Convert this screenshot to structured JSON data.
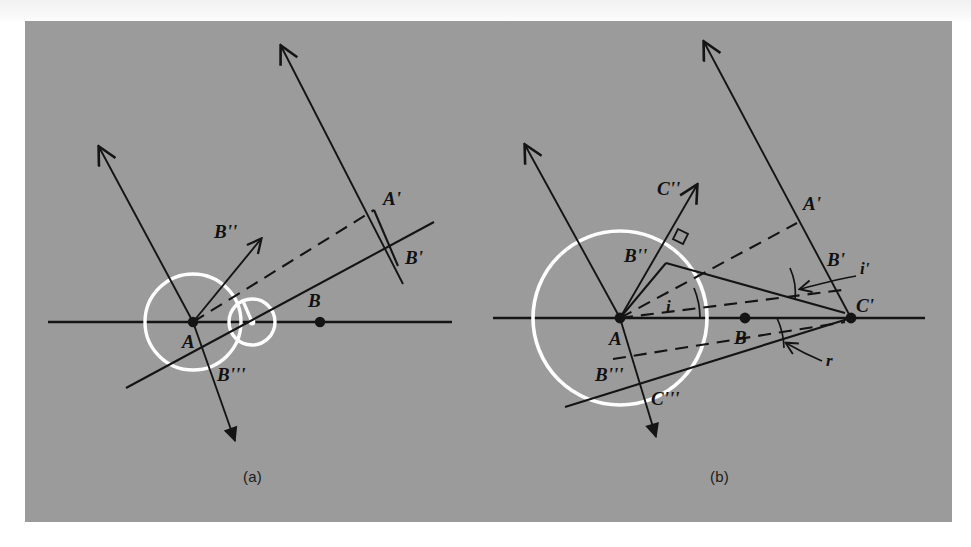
{
  "figure": {
    "kind": "huygens-refraction-construction",
    "panel_background_color": "#999999",
    "page_background_color": "#ffffff",
    "ray_color": "#141414",
    "wavelet_color": "#ffffff",
    "panels": [
      {
        "id": "a",
        "caption": "(a)",
        "points": [
          {
            "name": "A",
            "label": "A"
          },
          {
            "name": "B",
            "label": "B"
          },
          {
            "name": "A-prime",
            "label": "A'"
          },
          {
            "name": "B-prime",
            "label": "B'"
          },
          {
            "name": "B-double-prime",
            "label": "B''"
          },
          {
            "name": "B-triple-prime",
            "label": "B'''"
          }
        ],
        "angles": []
      },
      {
        "id": "b",
        "caption": "(b)",
        "points": [
          {
            "name": "A",
            "label": "A"
          },
          {
            "name": "B",
            "label": "B"
          },
          {
            "name": "A-prime",
            "label": "A'"
          },
          {
            "name": "B-prime",
            "label": "B'"
          },
          {
            "name": "C-prime",
            "label": "C'"
          },
          {
            "name": "B-double-prime",
            "label": "B''"
          },
          {
            "name": "C-double-prime",
            "label": "C''"
          },
          {
            "name": "B-triple-prime",
            "label": "B'''"
          },
          {
            "name": "C-triple-prime",
            "label": "C'''"
          }
        ],
        "angles": [
          {
            "name": "angle-of-incidence",
            "label": "i"
          },
          {
            "name": "angle-of-incidence-prime",
            "label": "i'"
          },
          {
            "name": "angle-of-refraction",
            "label": "r"
          }
        ]
      }
    ]
  },
  "labels": {
    "a": {
      "A": "A",
      "B": "B",
      "Ap": "A'",
      "Bp": "B'",
      "Bpp": "B''",
      "Bppp": "B'''",
      "caption": "(a)"
    },
    "b": {
      "A": "A",
      "B": "B",
      "Ap": "A'",
      "Bp": "B'",
      "Cp": "C'",
      "Bpp": "B''",
      "Cpp": "C''",
      "Bppp": "B'''",
      "Cppp": "C'''",
      "i": "i",
      "ip": "i'",
      "r": "r",
      "caption": "(b)"
    }
  }
}
